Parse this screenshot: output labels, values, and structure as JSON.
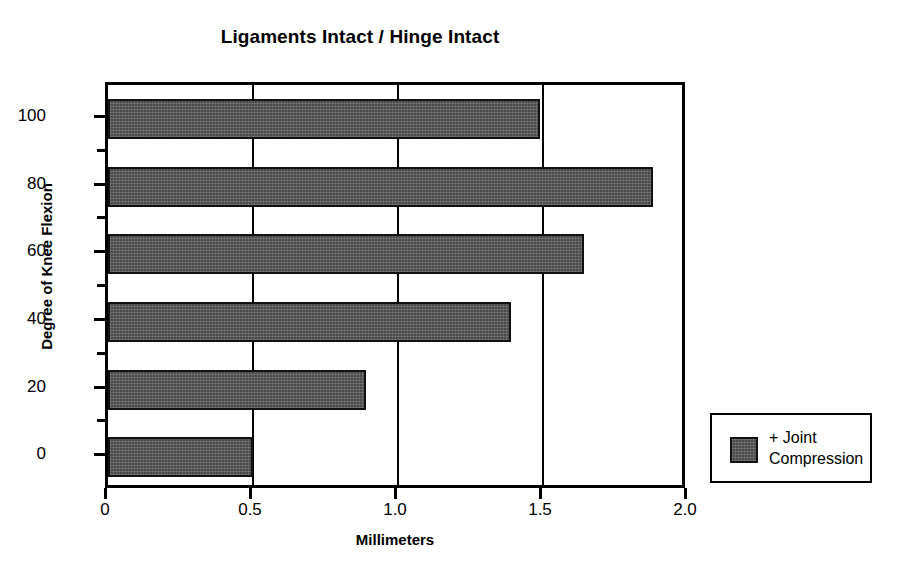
{
  "chart_data": {
    "type": "bar",
    "orientation": "horizontal",
    "title": "Ligaments Intact / Hinge Intact",
    "xlabel": "Millimeters",
    "ylabel": "Degree of Knee Flexion",
    "categories": [
      "0",
      "20",
      "40",
      "60",
      "80",
      "100"
    ],
    "values": [
      0.5,
      0.89,
      1.39,
      1.64,
      1.88,
      1.49
    ],
    "series": [
      {
        "name": "+ Joint Compression",
        "values": [
          0.5,
          0.89,
          1.39,
          1.64,
          1.88,
          1.49
        ]
      }
    ],
    "xlim": [
      0,
      2.0
    ],
    "x_ticks": [
      "0",
      "0.5",
      "1.0",
      "1.5",
      "2.0"
    ],
    "x_tick_values": [
      0,
      0.5,
      1.0,
      1.5,
      2.0
    ],
    "y_ticks": [
      "0",
      "20",
      "40",
      "60",
      "80",
      "100"
    ],
    "y_minor_ticks": [
      10,
      30,
      50,
      70,
      90
    ],
    "grid": "vertical",
    "legend_position": "right-bottom-outside",
    "bar_color": "#4a4a4a",
    "bar_edge_color": "#111111",
    "axis_color": "#000000",
    "background_color": "#ffffff"
  },
  "legend": {
    "entries": [
      {
        "label": "+ Joint\nCompression",
        "color": "#4a4a4a"
      }
    ]
  },
  "axis_labels": {
    "x": [
      "0",
      "0.5",
      "1.0",
      "1.5",
      "2.0"
    ],
    "y": [
      "100",
      "80",
      "60",
      "40",
      "20",
      "0"
    ]
  }
}
